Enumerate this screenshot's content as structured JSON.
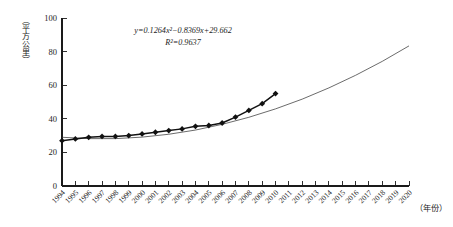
{
  "chart_data": {
    "type": "line",
    "title": "",
    "subtitle": "",
    "xlabel": "（年份）",
    "ylabel": "（平方公里）",
    "xlim": [
      1994,
      2020
    ],
    "ylim": [
      0,
      100
    ],
    "grid": false,
    "legend": "none",
    "x_tick_labels": [
      "1994",
      "1995",
      "1996",
      "1997",
      "1998",
      "1999",
      "2000",
      "2001",
      "2002",
      "2003",
      "2004",
      "2005",
      "2006",
      "2007",
      "2008",
      "2009",
      "2010",
      "2011",
      "2012",
      "2013",
      "2014",
      "2015",
      "2016",
      "2017",
      "2018",
      "2019",
      "2020"
    ],
    "y_tick_labels": [
      "0",
      "20",
      "40",
      "60",
      "80",
      "100"
    ],
    "y_ticks": [
      0,
      20,
      40,
      60,
      80,
      100
    ],
    "series": [
      {
        "name": "observed",
        "marker": "diamond",
        "x": [
          1994,
          1995,
          1996,
          1997,
          1998,
          1999,
          2000,
          2001,
          2002,
          2003,
          2004,
          2005,
          2006,
          2007,
          2008,
          2009,
          2010
        ],
        "values": [
          27,
          28,
          29,
          29.5,
          29.5,
          30,
          31,
          32,
          33,
          34,
          35.5,
          36,
          37.5,
          41,
          45,
          49,
          55
        ]
      },
      {
        "name": "fitted-trend",
        "marker": "none",
        "equation": "y=0.1264x²−0.8369x+29.662",
        "x": [
          1994,
          1996,
          1998,
          2000,
          2002,
          2004,
          2006,
          2008,
          2010,
          2012,
          2014,
          2016,
          2018,
          2020
        ],
        "values": [
          29.0,
          28.2,
          28.2,
          29.1,
          30.8,
          33.3,
          36.7,
          40.9,
          45.9,
          51.7,
          58.4,
          65.9,
          74.2,
          83.4
        ]
      }
    ],
    "annotations": {
      "equation": "y=0.1264x²−0.8369x+29.662",
      "r_squared": "R²=0.9637"
    }
  },
  "colors": {
    "axis": "#1a1a1a",
    "series": "#111111",
    "trend": "#3a3a3a",
    "background": "#ffffff"
  }
}
